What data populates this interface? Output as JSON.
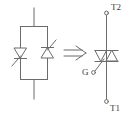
{
  "figure": {
    "stroke_color": "#666666",
    "label_color": "#3d3d3d",
    "background_color": "#ffffff",
    "width": 133,
    "height": 117
  },
  "left_circuit": {
    "name": "anti-parallel-thyristor-pair",
    "description": "Two thyristors connected in inverse parallel inside a rectangular loop",
    "devices": [
      {
        "name": "thyristor-left",
        "orientation": "cathode-down",
        "triangle_direction": "down",
        "gate_direction": "down-left"
      },
      {
        "name": "thyristor-right",
        "orientation": "cathode-up",
        "triangle_direction": "up",
        "gate_direction": "up-right"
      }
    ],
    "terminals": [
      "top-lead",
      "bottom-lead"
    ]
  },
  "implies_symbol": {
    "name": "implies-arrow",
    "glyph": "⇒",
    "meaning": "is equivalent to"
  },
  "right_circuit": {
    "name": "triac-symbol",
    "description": "Triac: two opposing triangles sharing a horizontal bar",
    "terminals": [
      {
        "id": "T2",
        "label": "T2",
        "position": "top"
      },
      {
        "id": "G",
        "label": "G",
        "position": "left-gate"
      },
      {
        "id": "T1",
        "label": "T1",
        "position": "bottom"
      }
    ]
  }
}
